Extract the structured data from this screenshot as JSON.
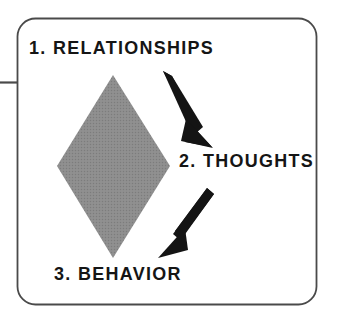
{
  "diagram": {
    "background_color": "#ffffff",
    "frame": {
      "name": "rounded-card-frame",
      "border_color": "#4a4a4a",
      "corner_radius": 18,
      "left": 17,
      "top": 18,
      "width": 300,
      "height": 287,
      "side_rule": {
        "name": "left-margin-rule",
        "y": 82,
        "from_x": 0,
        "to_x": 17,
        "color": "#4a4a4a"
      }
    },
    "nodes": [
      {
        "id": "relationships",
        "number": "1.",
        "label": "1. RELATIONSHIPS",
        "text_color": "#151515"
      },
      {
        "id": "thoughts",
        "number": "2.",
        "label": "2. THOUGHTS",
        "text_color": "#151515"
      },
      {
        "id": "behavior",
        "number": "3.",
        "label": "3. BEHAVIOR",
        "text_color": "#151515"
      }
    ],
    "diamond": {
      "name": "gray-diamond",
      "fill_color": "#8a8a8a",
      "pattern": "halftone-dither",
      "top_point": [
        113,
        75
      ],
      "right_point": [
        170,
        166
      ],
      "bottom_point": [
        113,
        258
      ],
      "left_point": [
        57,
        166
      ]
    },
    "arrows": [
      {
        "name": "arrow-relationships-to-thoughts",
        "color": "#141414",
        "from": [
          163,
          73
        ],
        "to": [
          208,
          143
        ],
        "direction": "down-right"
      },
      {
        "name": "arrow-thoughts-to-behavior",
        "color": "#141414",
        "from": [
          207,
          190
        ],
        "to": [
          160,
          257
        ],
        "direction": "down-left"
      }
    ]
  }
}
